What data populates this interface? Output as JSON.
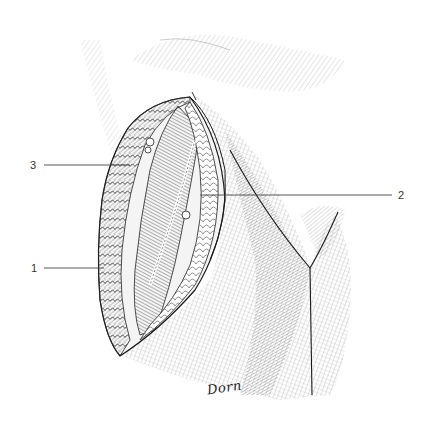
{
  "figure": {
    "type": "anatomical pen-and-ink illustration",
    "labels": [
      {
        "number": "1",
        "side": "left",
        "y": 268
      },
      {
        "number": "2",
        "side": "right",
        "y": 195
      },
      {
        "number": "3",
        "side": "left",
        "y": 165
      }
    ],
    "signature": "Dorn",
    "colors": {
      "background": "#ffffff",
      "ink": "#222222",
      "label_text": "#333333",
      "leader_line": "#444444"
    }
  }
}
